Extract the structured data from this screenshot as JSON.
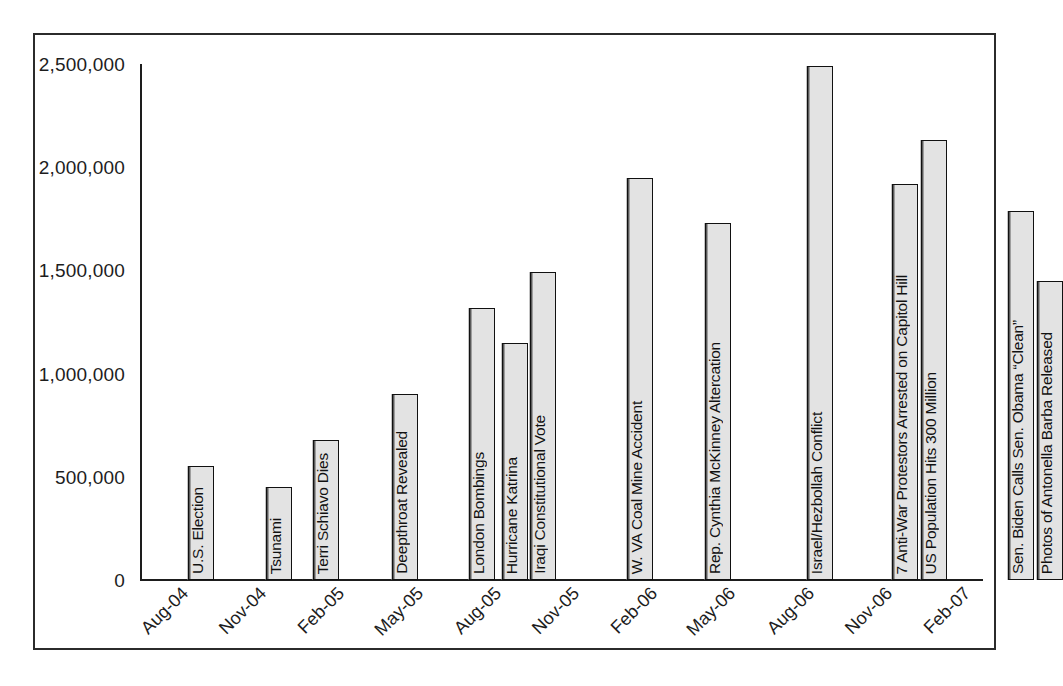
{
  "chart_data": {
    "type": "bar",
    "title": "",
    "subtitle": "",
    "xlabel": "",
    "ylabel": "",
    "ylim": [
      0,
      2500000
    ],
    "ytick_values": [
      0,
      500000,
      1000000,
      1500000,
      2000000,
      2500000
    ],
    "ytick_labels": [
      "0",
      "500,000",
      "1,000,000",
      "1,500,000",
      "2,000,000",
      "2,500,000"
    ],
    "xtick_labels": [
      "Aug-04",
      "Nov-04",
      "Feb-05",
      "May-05",
      "Aug-05",
      "Nov-05",
      "Feb-06",
      "May-06",
      "Aug-06",
      "Nov-06",
      "Feb-07"
    ],
    "grid": false,
    "legend": false,
    "legend_position": "none",
    "bar_fill_color": "#e3e3e3",
    "bar_edge_color": "#111111",
    "axis_color": "#1d1d1d",
    "frame_color": "#2b2b2b",
    "background_color": "#ffffff",
    "categories": [
      "U.S. Election",
      "Tsunami",
      "Terri Schiavo Dies",
      "Deepthroat Revealed",
      "London Bombings",
      "Hurricane Katrina",
      "Iraqi Constitutional Vote",
      "W. VA Coal Mine Accident",
      "Rep. Cynthia McKinney Altercation",
      "Israel/Hezbollah Conflict",
      "7 Anti-War Protestors Arrested on Capitol Hill",
      "US Population Hits 300 Million",
      "Sen. Biden Calls Sen. Obama “Clean”",
      "Photos of Antonella Barba Released"
    ],
    "values": [
      550000,
      450000,
      680000,
      900000,
      1320000,
      1150000,
      1490000,
      1950000,
      1730000,
      2490000,
      1920000,
      2130000,
      1790000,
      1450000
    ],
    "bars": [
      {
        "label": "U.S. Election",
        "value": 550000,
        "x_px": 48,
        "width_px": 26
      },
      {
        "label": "Tsunami",
        "value": 450000,
        "x_px": 126,
        "width_px": 26
      },
      {
        "label": "Terri Schiavo Dies",
        "value": 680000,
        "x_px": 173,
        "width_px": 26
      },
      {
        "label": "Deepthroat Revealed",
        "value": 900000,
        "x_px": 252,
        "width_px": 26
      },
      {
        "label": "London Bombings",
        "value": 1320000,
        "x_px": 329,
        "width_px": 26
      },
      {
        "label": "Hurricane Katrina",
        "value": 1150000,
        "x_px": 362,
        "width_px": 26
      },
      {
        "label": "Iraqi Constitutional Vote",
        "value": 1490000,
        "x_px": 390,
        "width_px": 26
      },
      {
        "label": "W. VA Coal Mine Accident",
        "value": 1950000,
        "x_px": 487,
        "width_px": 26
      },
      {
        "label": "Rep. Cynthia McKinney Altercation",
        "value": 1730000,
        "x_px": 565,
        "width_px": 26
      },
      {
        "label": "Israel/Hezbollah Conflict",
        "value": 2490000,
        "x_px": 667,
        "width_px": 26
      },
      {
        "label": "7 Anti-War Protestors Arrested on Capitol Hill",
        "value": 1920000,
        "x_px": 752,
        "width_px": 26
      },
      {
        "label": "US Population Hits 300 Million",
        "value": 2130000,
        "x_px": 781,
        "width_px": 26
      },
      {
        "label": "Sen. Biden Calls Sen. Obama “Clean”",
        "value": 1790000,
        "x_px": 868,
        "width_px": 26
      },
      {
        "label": "Photos of Antonella Barba Released",
        "value": 1450000,
        "x_px": 897,
        "width_px": 26
      }
    ]
  }
}
